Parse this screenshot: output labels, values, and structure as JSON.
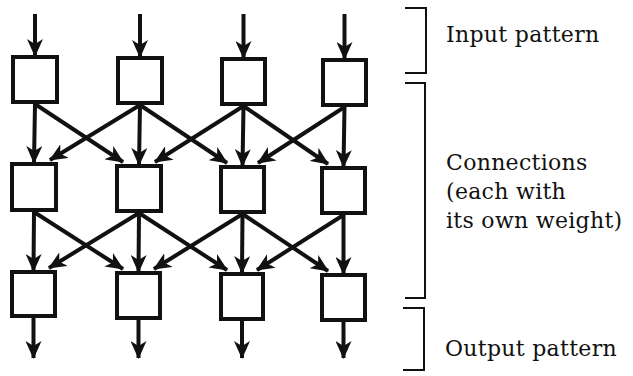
{
  "diagram": {
    "title": "",
    "ink_color": "#111111",
    "background_color": "#ffffff",
    "layers": [
      {
        "name": "input",
        "units": [
          {
            "x": 13,
            "y": 57,
            "w": 44,
            "h": 45
          },
          {
            "x": 118,
            "y": 58,
            "w": 44,
            "h": 45
          },
          {
            "x": 222,
            "y": 59,
            "w": 43,
            "h": 45
          },
          {
            "x": 323,
            "y": 60,
            "w": 43,
            "h": 45
          }
        ]
      },
      {
        "name": "hidden",
        "units": [
          {
            "x": 12,
            "y": 164,
            "w": 44,
            "h": 46
          },
          {
            "x": 117,
            "y": 166,
            "w": 44,
            "h": 45
          },
          {
            "x": 221,
            "y": 167,
            "w": 43,
            "h": 45
          },
          {
            "x": 322,
            "y": 168,
            "w": 43,
            "h": 45
          }
        ]
      },
      {
        "name": "output",
        "units": [
          {
            "x": 12,
            "y": 272,
            "w": 43,
            "h": 44
          },
          {
            "x": 117,
            "y": 273,
            "w": 43,
            "h": 45
          },
          {
            "x": 221,
            "y": 274,
            "w": 42,
            "h": 45
          },
          {
            "x": 322,
            "y": 275,
            "w": 43,
            "h": 45
          }
        ]
      }
    ],
    "connections_note": "Each unit connects to the unit directly below and to its immediate left/right neighbors in the next layer",
    "input_arrow_start_y": 14,
    "output_arrow_end_y": 358,
    "brackets": [
      {
        "name": "input-bracket",
        "x1": 405,
        "x2": 426,
        "y1": 8,
        "y2": 73
      },
      {
        "name": "connections-bracket",
        "x1": 405,
        "x2": 425,
        "y1": 83,
        "y2": 298
      },
      {
        "name": "output-bracket",
        "x1": 403,
        "x2": 424,
        "y1": 308,
        "y2": 370
      }
    ],
    "labels": {
      "input": "Input pattern",
      "connections_line1": "Connections",
      "connections_line2": "(each with",
      "connections_line3": "its own weight)",
      "output": "Output pattern"
    }
  }
}
